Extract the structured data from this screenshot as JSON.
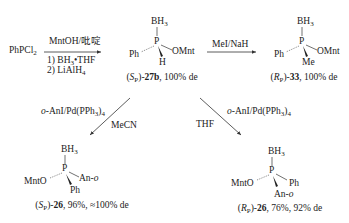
{
  "scheme": {
    "starting_material": {
      "text": "PhPCl",
      "sub": "2"
    },
    "step1": {
      "reagent_above": "MntOH/吡啶",
      "reagent_below_1": {
        "prefix": "1) BH",
        "sub": "3",
        "suffix": "•THF"
      },
      "reagent_below_2": {
        "prefix": "2) LiAlH",
        "sub": "4"
      }
    },
    "compound_27b": {
      "top": {
        "text": "BH",
        "sub": "3"
      },
      "center": "P",
      "left": "Ph",
      "right": "OMnt",
      "bottom": "H",
      "label": {
        "config": "S",
        "config_sub": "P",
        "number": "27b",
        "rest": ", 100% de"
      }
    },
    "step2": {
      "reagent_above": "MeI/NaH"
    },
    "compound_33": {
      "top": {
        "text": "BH",
        "sub": "3"
      },
      "center": "P",
      "left": "Ph",
      "right": "OMnt",
      "bottom": "Me",
      "label": {
        "config": "R",
        "config_sub": "P",
        "number": "33",
        "rest": ", 100% de"
      }
    },
    "step3_left": {
      "reagent": {
        "prefix": "o",
        "mid": "-AnI/Pd(PPh",
        "sub": "3",
        "suffix": ")",
        "sub2": "4"
      },
      "solvent": "MeCN"
    },
    "step3_right": {
      "reagent": {
        "prefix": "o",
        "mid": "-AnI/Pd(PPh",
        "sub": "3",
        "suffix": ")",
        "sub2": "4"
      },
      "solvent": "THF"
    },
    "compound_26_S": {
      "top": {
        "text": "BH",
        "sub": "3"
      },
      "center": "P",
      "left": "MntO",
      "right": {
        "text": "An-",
        "italic": "o"
      },
      "bottom": "Ph",
      "label": {
        "config": "S",
        "config_sub": "P",
        "number": "26",
        "rest": ", 96%, ≈100% de"
      }
    },
    "compound_26_R": {
      "top": {
        "text": "BH",
        "sub": "3"
      },
      "center": "P",
      "left": "MntO",
      "right": "Ph",
      "bottom": {
        "text": "An-",
        "italic": "o"
      },
      "label": {
        "config": "R",
        "config_sub": "P",
        "number": "26",
        "rest": ", 76%, 92% de"
      }
    }
  },
  "colors": {
    "ink": "#222222",
    "background": "#ffffff"
  }
}
